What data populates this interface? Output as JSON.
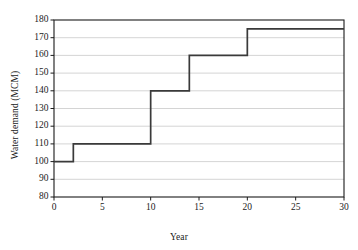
{
  "chart_data": {
    "type": "line",
    "subtype": "step-post",
    "title": "",
    "xlabel": "Year",
    "ylabel": "Water demand (MCM)",
    "xlim": [
      0,
      30
    ],
    "ylim": [
      80,
      180
    ],
    "xticks": [
      0,
      5,
      10,
      15,
      20,
      25,
      30
    ],
    "yticks": [
      80,
      90,
      100,
      110,
      120,
      130,
      140,
      150,
      160,
      170,
      180
    ],
    "grid": "horizontal",
    "legend": "none",
    "series": [
      {
        "name": "Water demand",
        "x": [
          0,
          2,
          10,
          14,
          20,
          30
        ],
        "y": [
          100,
          110,
          140,
          160,
          175,
          175
        ],
        "color": "#3a3a3a"
      }
    ],
    "steps": [
      {
        "x_start": 0,
        "x_end": 2,
        "value": 100
      },
      {
        "x_start": 2,
        "x_end": 10,
        "value": 110
      },
      {
        "x_start": 10,
        "x_end": 14,
        "value": 140
      },
      {
        "x_start": 14,
        "x_end": 20,
        "value": 160
      },
      {
        "x_start": 20,
        "x_end": 30,
        "value": 175
      }
    ]
  },
  "colors": {
    "line": "#3a3a3a",
    "axis": "#1b1b1b",
    "grid": "#c9c9c9",
    "background": "#ffffff"
  }
}
